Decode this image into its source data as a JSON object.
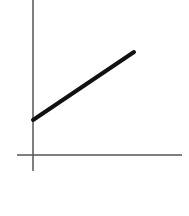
{
  "chart_data": {
    "type": "line",
    "title": "",
    "xlabel": "",
    "ylabel": "",
    "grid": false,
    "legend": null,
    "series": [
      {
        "name": "line",
        "x": [
          0,
          1
        ],
        "y": [
          1,
          2.2
        ]
      }
    ]
  },
  "geometry": {
    "y_axis": {
      "x": 33,
      "y1": 0,
      "y2": 171
    },
    "x_axis": {
      "y": 155,
      "x1": 17,
      "x2": 182
    },
    "line": {
      "x1": 33,
      "y1": 120,
      "x2": 134,
      "y2": 52
    },
    "colors": {
      "axis": "#555555",
      "line": "#111111",
      "background": "#ffffff"
    }
  }
}
